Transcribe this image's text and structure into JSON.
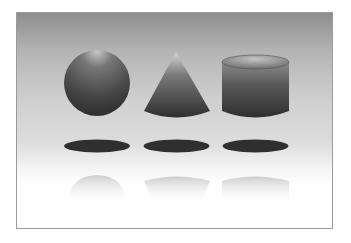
{
  "scene": {
    "description": "Three grey 3D primitive shapes with floor shadows and reflections on a gradient backdrop",
    "colors": {
      "frame_border": "#9a9a9a",
      "bg_top": "#8e8e8e",
      "bg_bottom": "#ffffff",
      "shape_dark": "#2e2e2e",
      "shape_light": "#bdbdbd",
      "shadow": "#2f2f2f"
    },
    "shapes": [
      {
        "name": "sphere"
      },
      {
        "name": "cone"
      },
      {
        "name": "cylinder"
      }
    ]
  }
}
